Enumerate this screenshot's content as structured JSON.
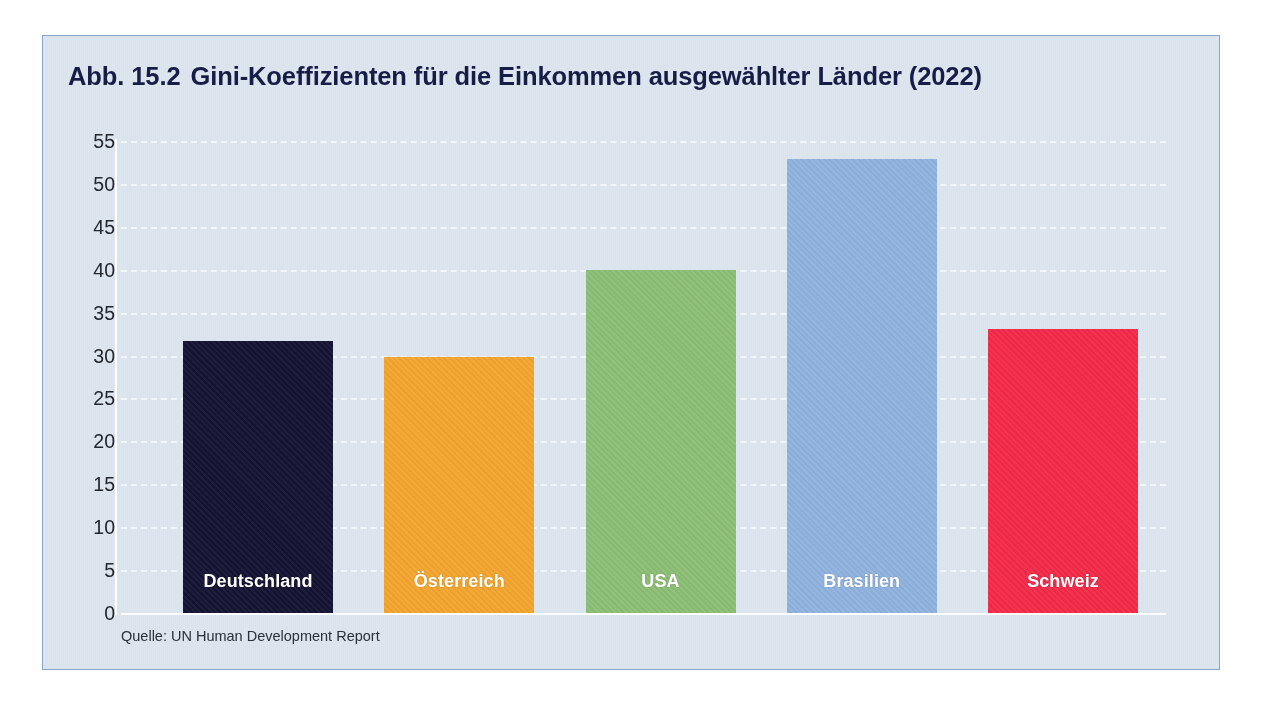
{
  "figure": {
    "label": "Abb. 15.2",
    "title": "Gini-Koeffizienten für die Einkommen ausgewählter Länder (2022)",
    "full_title": "Abb. 15.2  Gini-Koeffizienten für die Einkommen ausgewählter Länder (2022)",
    "source_note": "Quelle: UN Human Development Report",
    "panel_background": "#dde5ee",
    "panel_border": "#8aa4c8",
    "title_color": "#161d46",
    "gridline_color": "#f4f8fc"
  },
  "chart_data": {
    "type": "bar",
    "xlabel": "",
    "ylabel": "",
    "ylim": [
      0,
      55
    ],
    "yticks": [
      0,
      5,
      10,
      15,
      20,
      25,
      30,
      35,
      40,
      45,
      50,
      55
    ],
    "ytick_labels": [
      "0",
      "5",
      "10",
      "15",
      "20",
      "25",
      "30",
      "35",
      "40",
      "45",
      "50",
      "55"
    ],
    "grid": true,
    "legend": "none",
    "categories": [
      "Deutschland",
      "Österreich",
      "USA",
      "Brasilien",
      "Schweiz"
    ],
    "values": [
      31.7,
      29.8,
      40.0,
      52.9,
      33.1
    ],
    "colors": [
      "#141333",
      "#f4a52e",
      "#8cbf75",
      "#8fb3df",
      "#f42a49"
    ],
    "source": "Quelle: UN Human Development Report",
    "bars": [
      {
        "label": "Deutschland",
        "value": 31.7,
        "color": "#141333",
        "label_color": "#ffffff"
      },
      {
        "label": "Österreich",
        "value": 29.8,
        "color": "#f4a52e",
        "label_color": "#ffffff"
      },
      {
        "label": "USA",
        "value": 40.0,
        "color": "#8cbf75",
        "label_color": "#ffffff"
      },
      {
        "label": "Brasilien",
        "value": 52.9,
        "color": "#8fb3df",
        "label_color": "#ffffff"
      },
      {
        "label": "Schweiz",
        "value": 33.1,
        "color": "#f42a49",
        "label_color": "#ffffff"
      }
    ]
  }
}
